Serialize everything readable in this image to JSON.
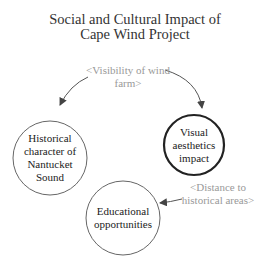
{
  "title": "Social and Cultural Impact of Cape Wind Project",
  "nodes": [
    {
      "id": "historical",
      "label": "Historical character of Nantucket Sound",
      "emphasis": false
    },
    {
      "id": "visual",
      "label": "Visual aesthetics impact",
      "emphasis": true
    },
    {
      "id": "educational",
      "label": "Educational opportunities",
      "emphasis": false
    }
  ],
  "edges": [
    {
      "label": "<Visibility of wind farm>",
      "targets": [
        "historical",
        "visual"
      ]
    },
    {
      "label": "<Distance to historical areas>",
      "targets": [
        "educational"
      ]
    }
  ],
  "colors": {
    "node_stroke": "#555555",
    "emphasis_stroke": "#222222",
    "edge_label": "#999999",
    "arrow": "#555555"
  }
}
